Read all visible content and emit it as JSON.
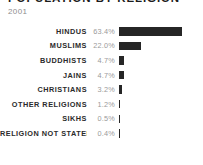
{
  "header": {
    "title": "POPULATION BY RELIGION",
    "subtitle": "2001"
  },
  "chart_data": {
    "type": "bar",
    "orientation": "horizontal",
    "title": "POPULATION BY RELIGION",
    "subtitle": "2001",
    "xlabel": "",
    "ylabel": "",
    "unit": "%",
    "grid": false,
    "legend": false,
    "xlim": [
      0,
      63.4
    ],
    "bar_color": "#262626",
    "categories": [
      "HINDUS",
      "MUSLIMS",
      "BUDDHISTS",
      "JAINS",
      "CHRISTIANS",
      "OTHER RELIGIONS",
      "SIKHS",
      "RELIGION NOT STATED"
    ],
    "values": [
      63.4,
      22.0,
      4.7,
      4.7,
      3.2,
      1.2,
      0.5,
      0.4
    ],
    "value_labels": [
      "63.4%",
      "22.0%",
      "4.7%",
      "4.7%",
      "3.2%",
      "1.2%",
      "0.5%",
      "0.4%"
    ],
    "rows": [
      {
        "label": "HINDUS",
        "value": 63.4,
        "value_label": "63.4%"
      },
      {
        "label": "MUSLIMS",
        "value": 22.0,
        "value_label": "22.0%"
      },
      {
        "label": "BUDDHISTS",
        "value": 4.7,
        "value_label": "4.7%"
      },
      {
        "label": "JAINS",
        "value": 4.7,
        "value_label": "4.7%"
      },
      {
        "label": "CHRISTIANS",
        "value": 3.2,
        "value_label": "3.2%"
      },
      {
        "label": "OTHER RELIGIONS",
        "value": 1.2,
        "value_label": "1.2%"
      },
      {
        "label": "SIKHS",
        "value": 0.5,
        "value_label": "0.5%"
      },
      {
        "label": "RELIGION NOT STATED",
        "value": 0.4,
        "value_label": "0.4%"
      }
    ]
  }
}
